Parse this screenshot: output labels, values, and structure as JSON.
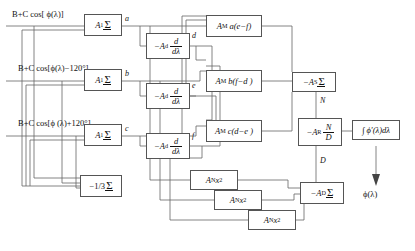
{
  "diagram": {
    "caption": "",
    "inputs": [
      {
        "id": "in-1",
        "label": "B+C cos[ ϕ(λ)]"
      },
      {
        "id": "in-2",
        "label": "B+C cos[ϕ(λ)−120°]"
      },
      {
        "id": "in-3",
        "label": "B+C cos[ϕ (λ)+120°]"
      }
    ],
    "sum_blocks": [
      {
        "id": "sum-a",
        "gain": "A",
        "gain_sub": "1",
        "symbol": "Σ",
        "out_signal": "a"
      },
      {
        "id": "sum-b",
        "gain": "A",
        "gain_sub": "1",
        "symbol": "Σ",
        "out_signal": "b"
      },
      {
        "id": "sum-c",
        "gain": "A",
        "gain_sub": "1",
        "symbol": "Σ",
        "out_signal": "c"
      }
    ],
    "bias_block": {
      "id": "bias",
      "label": "−1/3",
      "symbol": "Σ"
    },
    "derivative_blocks": [
      {
        "id": "deriv-d",
        "gain": "−A",
        "gain_sub": "d",
        "num": "d",
        "den": "dλ",
        "out_signal": "d"
      },
      {
        "id": "deriv-e",
        "gain": "−A",
        "gain_sub": "d",
        "num": "d",
        "den": "dλ",
        "out_signal": "e"
      },
      {
        "id": "deriv-f",
        "gain": "−A",
        "gain_sub": "d",
        "num": "d",
        "den": "dλ",
        "out_signal": "f"
      }
    ],
    "multiplier_blocks": [
      {
        "id": "mult-a",
        "gain": "A",
        "gain_sub": "M",
        "expr": "a(e−f)"
      },
      {
        "id": "mult-b",
        "gain": "A",
        "gain_sub": "M",
        "expr": "b(f−d )"
      },
      {
        "id": "mult-c",
        "gain": "A",
        "gain_sub": "M",
        "expr": "c(d−e )"
      }
    ],
    "square_blocks": [
      {
        "id": "sq-1",
        "gain": "A",
        "gain_sub": "N",
        "var": "x",
        "power": "2"
      },
      {
        "id": "sq-2",
        "gain": "A",
        "gain_sub": "N",
        "var": "x",
        "power": "2"
      },
      {
        "id": "sq-3",
        "gain": "A",
        "gain_sub": "N",
        "var": "x",
        "power": "2"
      }
    ],
    "numerator_sum": {
      "id": "sum-n",
      "gain": "−A",
      "gain_sub": "S",
      "symbol": "Σ"
    },
    "denominator_sum": {
      "id": "sum-d",
      "gain": "−A",
      "gain_sub": "D",
      "symbol": "Σ"
    },
    "ratio_block": {
      "id": "ratio",
      "gain": "−A",
      "gain_sub": "R",
      "num": "N",
      "den": "D"
    },
    "integrator_block": {
      "id": "integrator",
      "label": "∫ ϕ′(λ)dλ"
    },
    "signals": {
      "a": "a",
      "b": "b",
      "c": "c",
      "d": "d",
      "e": "e",
      "f": "f",
      "N": "N",
      "D": "D"
    },
    "output_label": "ϕ(λ)"
  }
}
